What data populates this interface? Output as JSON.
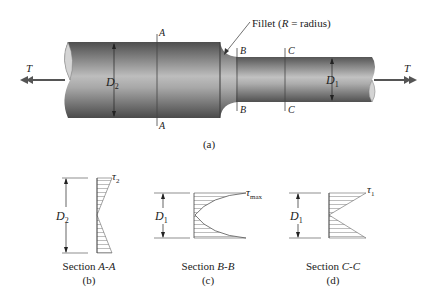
{
  "figure": {
    "main": {
      "caption": "(a)",
      "torque_left": "T",
      "torque_right": "T",
      "diameter_large": {
        "symbol": "D",
        "sub": "2"
      },
      "diameter_small": {
        "symbol": "D",
        "sub": "1"
      },
      "fillet_label_pre": "Fillet (",
      "fillet_label_R": "R",
      "fillet_label_post": " = radius)",
      "section_marks": {
        "A_top": "A",
        "A_bottom": "A",
        "B_top": "B",
        "B_bottom": "B",
        "C_top": "C",
        "C_bottom": "C"
      }
    },
    "sections": [
      {
        "id": "b",
        "title_pre": "Section ",
        "title_it": "A-A",
        "caption": "(b)",
        "diameter": {
          "symbol": "D",
          "sub": "2"
        },
        "stress": {
          "symbol": "τ",
          "sub": "2"
        },
        "profile": "linear"
      },
      {
        "id": "c",
        "title_pre": "Section ",
        "title_it": "B-B",
        "caption": "(c)",
        "diameter": {
          "symbol": "D",
          "sub": "1"
        },
        "stress": {
          "symbol": "τ",
          "sub": "max"
        },
        "profile": "parabolic"
      },
      {
        "id": "d",
        "title_pre": "Section ",
        "title_it": "C-C",
        "caption": "(d)",
        "diameter": {
          "symbol": "D",
          "sub": "1"
        },
        "stress": {
          "symbol": "τ",
          "sub": "1"
        },
        "profile": "linear"
      }
    ]
  },
  "colors": {
    "shaft_dark": "#5a5a5a",
    "shaft_light": "#b8b8b8",
    "end_face": "#d0d0d0",
    "line": "#333333",
    "hatch": "#9a9a9a",
    "arrow": "#555555"
  }
}
